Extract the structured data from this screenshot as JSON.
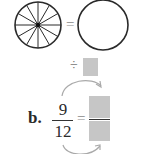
{
  "figure": {
    "top_row": {
      "divided_circle": {
        "slices": 12,
        "stroke": "#2a2a2a"
      },
      "equals_sign": "=",
      "blank_circle": {
        "stroke": "#2a2a2a"
      }
    },
    "operation": {
      "symbol": "÷",
      "box_color": "#c6c6c6"
    },
    "part_b": {
      "label": "b.",
      "numerator": "9",
      "denominator": "12",
      "equals_sign": "=",
      "answer_box_color": "#c6c6c6"
    }
  }
}
